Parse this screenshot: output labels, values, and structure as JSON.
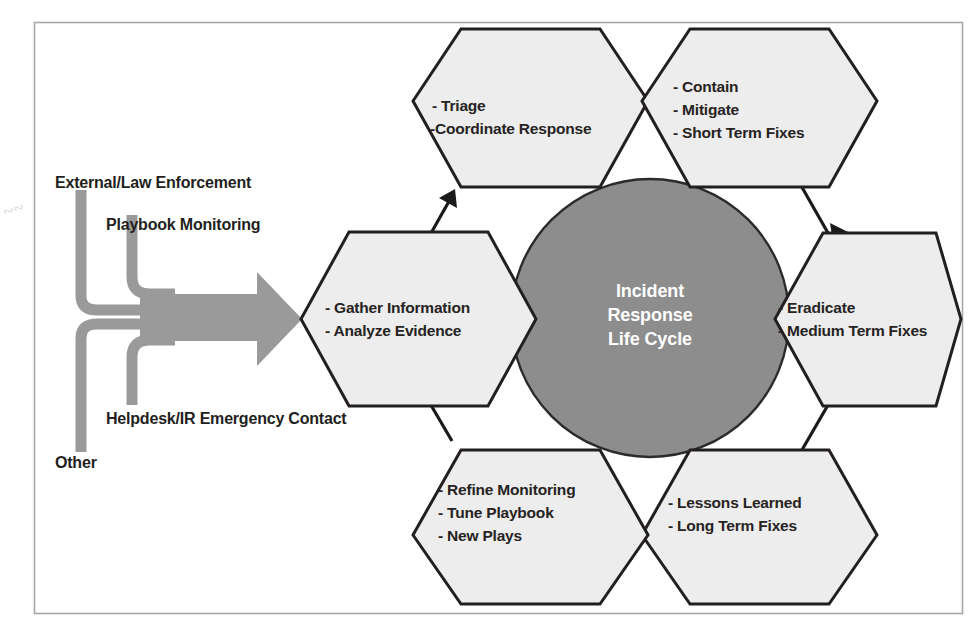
{
  "figure": {
    "title": "Incident Response Life Cycle",
    "center": {
      "line1": "Incident",
      "line2": "Response",
      "line3": "Life Cycle",
      "fill_color": "#8d8d8d",
      "text_color": "#ffffff"
    },
    "border_color": "#a8a8a8",
    "hex_fill_color": "#ededed",
    "hex_stroke_color": "#231f20",
    "arrow_color": "#1a1a1a",
    "input_arrow_color": "#9a9a9a",
    "stages": [
      {
        "id": "gather",
        "position": "left",
        "lines": [
          "- Gather Information",
          "- Analyze Evidence"
        ]
      },
      {
        "id": "triage",
        "position": "top-left",
        "lines": [
          "- Triage",
          "-Coordinate Response"
        ]
      },
      {
        "id": "contain",
        "position": "top-right",
        "lines": [
          "- Contain",
          "- Mitigate",
          "- Short Term Fixes"
        ]
      },
      {
        "id": "eradicate",
        "position": "right",
        "lines": [
          "- Eradicate",
          "- Medium Term Fixes"
        ]
      },
      {
        "id": "lessons",
        "position": "bottom-right",
        "lines": [
          "- Lessons Learned",
          "- Long Term Fixes"
        ]
      },
      {
        "id": "refine",
        "position": "bottom-left",
        "lines": [
          "- Refine Monitoring",
          "- Tune Playbook",
          "- New Plays"
        ]
      }
    ],
    "inputs": [
      {
        "id": "external",
        "label": "External/Law Enforcement"
      },
      {
        "id": "playbook",
        "label": "Playbook Monitoring"
      },
      {
        "id": "helpdesk",
        "label": "Helpdesk/IR Emergency Contact"
      },
      {
        "id": "other",
        "label": "Other"
      }
    ],
    "flow_arrows": [
      {
        "from": "gather",
        "to": "triage"
      },
      {
        "from": "triage",
        "to": "contain"
      },
      {
        "from": "contain",
        "to": "eradicate"
      },
      {
        "from": "eradicate",
        "to": "lessons"
      },
      {
        "from": "lessons",
        "to": "refine"
      },
      {
        "from": "refine",
        "to": "gather"
      }
    ]
  }
}
